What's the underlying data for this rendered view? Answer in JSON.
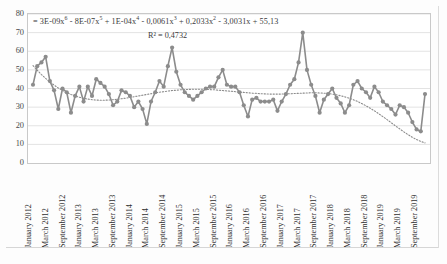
{
  "chart_data": {
    "type": "line",
    "title": "",
    "xlabel": "",
    "ylabel": "",
    "ylim": [
      0,
      80
    ],
    "ytick_values": [
      0,
      10,
      20,
      30,
      40,
      50,
      60,
      70,
      80
    ],
    "grid": true,
    "legend_position": "none",
    "marker": "circle",
    "series_color": "#8c8c8c",
    "trendline_color": "#8c8c8c",
    "trendline_style": "dotted",
    "trendline_equation": "y = 3E-09x⁶ - 8E-07x⁵ + 1E-04x⁴ - 0,0061x³ + 0,2033x² - 3,0031x + 55,13",
    "trendline_equation_parts": {
      "prefix": "= ",
      "terms": [
        {
          "coef": "3E-09x",
          "exp": "6",
          "op": ""
        },
        {
          "coef": "8E-07x",
          "exp": "5",
          "op": " - "
        },
        {
          "coef": "1E-04x",
          "exp": "4",
          "op": " + "
        },
        {
          "coef": "0,0061x",
          "exp": "3",
          "op": " - "
        },
        {
          "coef": "0,2033x",
          "exp": "2",
          "op": " + "
        },
        {
          "coef": "3,0031x",
          "exp": "",
          "op": " - "
        },
        {
          "coef": "55,13",
          "exp": "",
          "op": " + "
        }
      ]
    },
    "r_squared_label": "R² = 0,4732",
    "r_squared_value": 0.4732,
    "xtick_labels": [
      "January 2012",
      "March 2012",
      "September 2012",
      "January 2013",
      "March 2013",
      "September 2013",
      "January 2014",
      "March 2014",
      "September 2014",
      "January 2015",
      "March 2015",
      "September 2015",
      "January 2016",
      "March 2016",
      "September 2016",
      "January 2017",
      "March 2017",
      "September 2017",
      "January 2018",
      "March 2018",
      "September 2018",
      "January 2019",
      "March 2019",
      "September 2019"
    ],
    "x": [
      "January 2012",
      "February 2012",
      "March 2012",
      "April 2012",
      "May 2012",
      "June 2012",
      "July 2012",
      "August 2012",
      "September 2012",
      "October 2012",
      "November 2012",
      "December 2012",
      "January 2013",
      "February 2013",
      "March 2013",
      "April 2013",
      "May 2013",
      "June 2013",
      "July 2013",
      "August 2013",
      "September 2013",
      "October 2013",
      "November 2013",
      "December 2013",
      "January 2014",
      "February 2014",
      "March 2014",
      "April 2014",
      "May 2014",
      "June 2014",
      "July 2014",
      "August 2014",
      "September 2014",
      "October 2014",
      "November 2014",
      "December 2014",
      "January 2015",
      "February 2015",
      "March 2015",
      "April 2015",
      "May 2015",
      "June 2015",
      "July 2015",
      "August 2015",
      "September 2015",
      "October 2015",
      "November 2015",
      "December 2015",
      "January 2016",
      "February 2016",
      "March 2016",
      "April 2016",
      "May 2016",
      "June 2016",
      "July 2016",
      "August 2016",
      "September 2016",
      "October 2016",
      "November 2016",
      "December 2016",
      "January 2017",
      "February 2017",
      "March 2017",
      "April 2017",
      "May 2017",
      "June 2017",
      "July 2017",
      "August 2017",
      "September 2017",
      "October 2017",
      "November 2017",
      "December 2017",
      "January 2018",
      "February 2018",
      "March 2018",
      "April 2018",
      "May 2018",
      "June 2018",
      "July 2018",
      "August 2018",
      "September 2018",
      "October 2018",
      "November 2018",
      "December 2018",
      "January 2019",
      "February 2019",
      "March 2019",
      "April 2019",
      "May 2019",
      "June 2019",
      "July 2019",
      "August 2019",
      "September 2019",
      "October 2019"
    ],
    "values": [
      42,
      52,
      54,
      57,
      44,
      39,
      29,
      40,
      38,
      27,
      36,
      41,
      33,
      41,
      36,
      45,
      43,
      41,
      37,
      31,
      33,
      39,
      38,
      36,
      30,
      33,
      29,
      21,
      33,
      38,
      44,
      41,
      52,
      62,
      49,
      42,
      38,
      36,
      34,
      36,
      38,
      40,
      41,
      41,
      46,
      50,
      42,
      41,
      41,
      38,
      31,
      25,
      34,
      35,
      33,
      33,
      33,
      34,
      28,
      33,
      37,
      42,
      45,
      54,
      70,
      50,
      42,
      36,
      27,
      34,
      37,
      40,
      35,
      32,
      27,
      31,
      42,
      44,
      40,
      38,
      35,
      41,
      38,
      33,
      31,
      29,
      26,
      31,
      30,
      27,
      22,
      18,
      17,
      37
    ],
    "trendline_values": [
      52.3,
      49.8,
      47.5,
      45.4,
      43.5,
      41.8,
      40.3,
      39.0,
      37.8,
      36.8,
      36.0,
      35.3,
      34.7,
      34.3,
      34.0,
      33.8,
      33.7,
      33.7,
      33.8,
      34.0,
      34.2,
      34.5,
      34.8,
      35.2,
      35.6,
      36.0,
      36.4,
      36.8,
      37.2,
      37.6,
      38.0,
      38.3,
      38.6,
      38.9,
      39.1,
      39.3,
      39.4,
      39.5,
      39.6,
      39.6,
      39.6,
      39.5,
      39.4,
      39.3,
      39.1,
      38.9,
      38.7,
      38.5,
      38.3,
      38.1,
      37.9,
      37.7,
      37.5,
      37.4,
      37.2,
      37.1,
      37.0,
      37.0,
      37.0,
      37.0,
      37.1,
      37.2,
      37.3,
      37.4,
      37.5,
      37.6,
      37.7,
      37.7,
      37.6,
      37.5,
      37.3,
      37.0,
      36.6,
      36.1,
      35.5,
      34.8,
      34.0,
      33.0,
      31.9,
      30.7,
      29.4,
      28.0,
      26.5,
      24.9,
      23.3,
      21.6,
      19.9,
      18.3,
      16.7,
      15.2,
      13.8,
      12.6,
      11.6,
      10.8
    ]
  }
}
